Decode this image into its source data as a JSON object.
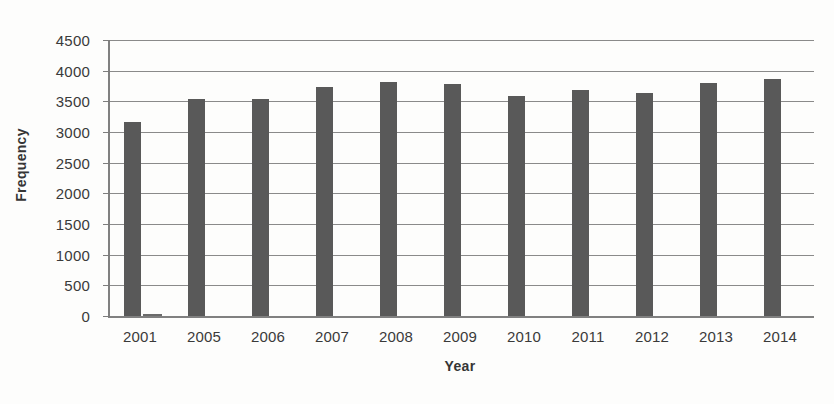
{
  "chart_data": {
    "type": "bar",
    "title": "",
    "xlabel": "Year",
    "ylabel": "Frequency",
    "categories": [
      "2001",
      "2005",
      "2006",
      "2007",
      "2008",
      "2009",
      "2010",
      "2011",
      "2012",
      "2013",
      "2014"
    ],
    "series": [
      {
        "name": "Frequency",
        "values": [
          3163,
          3545,
          3537,
          3740,
          3820,
          3780,
          3595,
          3690,
          3640,
          3800,
          3865
        ]
      },
      {
        "name": "Secondary",
        "values": [
          30,
          0,
          0,
          0,
          0,
          0,
          0,
          0,
          0,
          0,
          0
        ]
      }
    ],
    "ylim": [
      0,
      4500
    ],
    "y_ticks": [
      0,
      500,
      1000,
      1500,
      2000,
      2500,
      3000,
      3500,
      4000,
      4500
    ],
    "y_tick_labels": [
      "0",
      "500",
      "1000",
      "1500",
      "2000",
      "2500",
      "3000",
      "3500",
      "4000",
      "4500"
    ],
    "grid": true,
    "legend": "none",
    "bar_color": "#595959",
    "grid_color": "#8a8a8a",
    "axis_color": "#808080"
  }
}
